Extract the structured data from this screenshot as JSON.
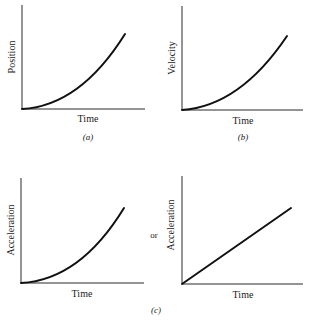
{
  "figure": {
    "panels": [
      {
        "id": "a",
        "ylabel": "Position",
        "xlabel": "Time",
        "caption": "(a)",
        "curve": "quadratic"
      },
      {
        "id": "b",
        "ylabel": "Velocity",
        "xlabel": "Time",
        "caption": "(b)",
        "curve": "quadratic"
      },
      {
        "id": "c-left",
        "ylabel": "Acceleration",
        "xlabel": "Time",
        "curve": "quadratic"
      },
      {
        "id": "c-right",
        "ylabel": "Acceleration",
        "xlabel": "Time",
        "curve": "linear"
      }
    ],
    "or_label": "or",
    "caption_c": "(c)"
  }
}
